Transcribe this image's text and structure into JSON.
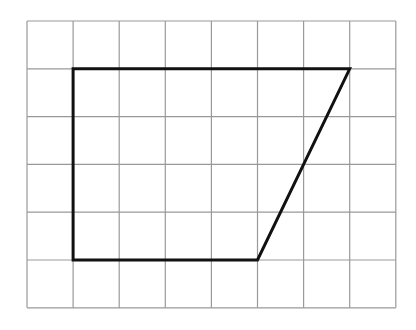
{
  "diagram": {
    "type": "grid-shape",
    "grid": {
      "columns": 8,
      "rows": 6,
      "origin_x": 27,
      "origin_y": 21,
      "cell_width": 46.1,
      "cell_height": 47.8,
      "line_color": "#999999",
      "line_width": 1.2
    },
    "shape": {
      "name": "trapezoid",
      "stroke_color": "#111111",
      "stroke_width": 3,
      "vertices_grid": [
        [
          1,
          1
        ],
        [
          7,
          1
        ],
        [
          5,
          5
        ],
        [
          1,
          5
        ]
      ]
    }
  }
}
